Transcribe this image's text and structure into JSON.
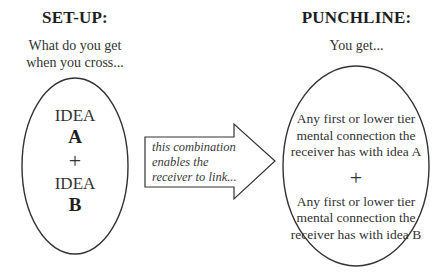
{
  "setup": {
    "heading": "SET-UP:",
    "prompt_line1": "What do you get",
    "prompt_line2": "when you cross...",
    "ellipse": {
      "idea_a_label": "IDEA",
      "idea_a_letter": "A",
      "plus": "+",
      "idea_b_label": "IDEA",
      "idea_b_letter": "B"
    }
  },
  "arrow": {
    "line1": "this combination",
    "line2": "enables the",
    "line3": "receiver to link..."
  },
  "punchline": {
    "heading": "PUNCHLINE:",
    "prompt": "You get...",
    "ellipse": {
      "a_line1": "Any first or lower tier",
      "a_line2": "mental connection the",
      "a_line3": "receiver has with idea A",
      "plus": "+",
      "b_line1": "Any first or lower tier",
      "b_line2": "mental connection the",
      "b_line3": "receiver has with idea B"
    }
  },
  "colors": {
    "stroke": "#333333",
    "text": "#2a2a2a",
    "background": "#ffffff"
  }
}
